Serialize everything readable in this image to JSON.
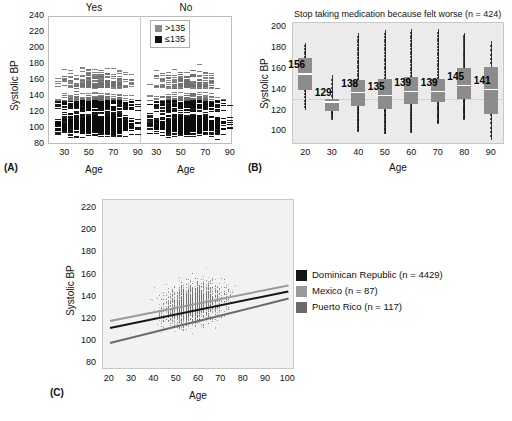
{
  "figure": {
    "panels": [
      "(A)",
      "(B)",
      "(C)"
    ]
  },
  "chart_data": [
    {
      "panel": "(A)",
      "type": "scatter",
      "title": "",
      "xlabel": "Age",
      "ylabel": "Systolic BP",
      "ylim": [
        80,
        240
      ],
      "yticks": [
        80,
        100,
        120,
        140,
        160,
        180,
        200,
        220,
        240
      ],
      "groups": [
        "Yes",
        "No"
      ],
      "xticks": [
        30,
        50,
        70,
        90
      ],
      "legend": {
        "position": "top-right",
        "entries": [
          {
            "label": ">135",
            "color": "#8c8c8c"
          },
          {
            "label": "≤135",
            "color": "#111111"
          }
        ]
      },
      "threshold": 135,
      "series": [
        {
          "name": "Yes",
          "x": [
            25,
            30,
            35,
            40,
            45,
            50,
            55,
            60,
            65,
            70,
            75,
            80,
            85,
            90
          ],
          "counts": [
            40,
            95,
            110,
            150,
            185,
            230,
            260,
            275,
            250,
            215,
            150,
            90,
            45,
            12
          ],
          "max": [
            162,
            184,
            196,
            203,
            224,
            232,
            239,
            241,
            244,
            238,
            208,
            190,
            188,
            176
          ],
          "min": [
            92,
            88,
            84,
            82,
            80,
            78,
            78,
            76,
            78,
            78,
            80,
            82,
            84,
            88
          ]
        },
        {
          "name": "No",
          "x": [
            25,
            30,
            35,
            40,
            45,
            50,
            55,
            60,
            65,
            70,
            75,
            80,
            85,
            90
          ],
          "counts": [
            30,
            85,
            100,
            135,
            170,
            205,
            225,
            235,
            215,
            180,
            120,
            70,
            35,
            10
          ],
          "max": [
            155,
            172,
            188,
            190,
            191,
            187,
            186,
            200,
            202,
            186,
            170,
            150,
            136,
            133
          ],
          "min": [
            88,
            84,
            80,
            78,
            78,
            76,
            76,
            76,
            78,
            80,
            82,
            86,
            92,
            100
          ]
        }
      ]
    },
    {
      "panel": "(B)",
      "type": "boxplot",
      "title": "Stop taking medication because felt worse (n = 424)",
      "xlabel": "Age",
      "ylabel": "Systolic BP",
      "ylim": [
        88,
        205
      ],
      "yticks": [
        100,
        120,
        140,
        160,
        180,
        200
      ],
      "xticks": [
        20,
        30,
        40,
        50,
        60,
        70,
        80,
        90
      ],
      "reference_line": 120,
      "boxes": [
        {
          "age": 20,
          "median": 156,
          "q1": 140,
          "q3": 170,
          "lower": 121,
          "upper": 185,
          "label": "156"
        },
        {
          "age": 30,
          "median": 129,
          "q1": 120,
          "q3": 131,
          "lower": 112,
          "upper": 154,
          "label": "129"
        },
        {
          "age": 40,
          "median": 138,
          "q1": 124,
          "q3": 149,
          "lower": 100,
          "upper": 194,
          "label": "138"
        },
        {
          "age": 50,
          "median": 135,
          "q1": 122,
          "q3": 150,
          "lower": 98,
          "upper": 197,
          "label": "135"
        },
        {
          "age": 60,
          "median": 139,
          "q1": 126,
          "q3": 152,
          "lower": 99,
          "upper": 198,
          "label": "139"
        },
        {
          "age": 70,
          "median": 139,
          "q1": 128,
          "q3": 150,
          "lower": 108,
          "upper": 198,
          "label": "139"
        },
        {
          "age": 80,
          "median": 145,
          "q1": 131,
          "q3": 161,
          "lower": 112,
          "upper": 194,
          "label": "145"
        },
        {
          "age": 90,
          "median": 141,
          "q1": 117,
          "q3": 162,
          "lower": 92,
          "upper": 187,
          "label": "141"
        }
      ]
    },
    {
      "panel": "(C)",
      "type": "scatter",
      "title": "",
      "xlabel": "Age",
      "ylabel": "Systolic BP",
      "ylim": [
        75,
        228
      ],
      "yticks": [
        80,
        100,
        120,
        140,
        160,
        180,
        200,
        220
      ],
      "xlim": [
        17,
        103
      ],
      "xticks": [
        20,
        30,
        40,
        50,
        60,
        70,
        80,
        90,
        100
      ],
      "legend": {
        "position": "right",
        "entries": [
          {
            "label": "Dominican Republic (n = 4429)",
            "color": "#161616"
          },
          {
            "label": "Mexico (n = 87)",
            "color": "#9a9a9a"
          },
          {
            "label": "Puerto Rico (n = 117)",
            "color": "#6a6a6a"
          }
        ]
      },
      "regression_lines": [
        {
          "name": "Dominican Republic",
          "color": "#161616",
          "x": [
            20,
            100
          ],
          "y": [
            114,
            147
          ]
        },
        {
          "name": "Mexico",
          "color": "#9a9a9a",
          "x": [
            20,
            100
          ],
          "y": [
            120,
            152
          ]
        },
        {
          "name": "Puerto Rico",
          "color": "#6a6a6a",
          "x": [
            20,
            100
          ],
          "y": [
            100,
            140
          ]
        }
      ],
      "scatter_cloud": {
        "n_points": 4633,
        "x_center": 57,
        "y_center": 140,
        "density_note": "dense vertical banding at integer ages, heaviest 45-75"
      }
    }
  ]
}
